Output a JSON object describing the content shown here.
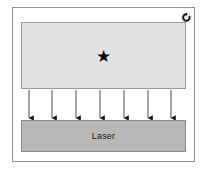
{
  "figure": {
    "background_color": "#ffffff",
    "frame": {
      "name": "panel-frame",
      "border_color": "#8f8f8f",
      "fill_color": "#ffffff"
    },
    "icon": {
      "name": "reload-icon",
      "semantic": "reload-icon",
      "color": "#1a1a1a",
      "background": "#e9e9e9"
    },
    "sample_block": {
      "label": "",
      "fill_color": "#e2e2e2",
      "border_color": "#9a9a9a",
      "marker": {
        "name": "star-marker",
        "glyph": "★",
        "color": "#0a0a0a"
      }
    },
    "laser_block": {
      "label": "Laser",
      "fill_color": "#b8b8b8",
      "border_color": "#8b8b8b",
      "text_color": "#1a1a1a"
    },
    "beams": {
      "name": "beam-arrows",
      "count": 7,
      "direction": "up-to-down",
      "color": "#1a1a1a",
      "x_positions": [
        29,
        52,
        76,
        100,
        124,
        148,
        171
      ],
      "y_start": 90,
      "y_end": 118
    }
  }
}
